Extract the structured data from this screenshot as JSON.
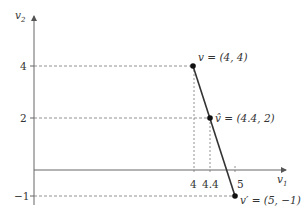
{
  "diagram": {
    "axes": {
      "x_label": "v",
      "x_label_sub": "1",
      "y_label": "v",
      "y_label_sub": "2"
    },
    "y_ticks": [
      {
        "value": 4,
        "label": "4"
      },
      {
        "value": 2,
        "label": "2"
      },
      {
        "value": -1,
        "label": "−1"
      }
    ],
    "x_ticks": [
      {
        "value": 4,
        "label": "4"
      },
      {
        "value": 4.4,
        "label": "4.4"
      },
      {
        "value": 5,
        "label": "5"
      }
    ],
    "points": [
      {
        "name": "v",
        "label": "v = (4, 4)",
        "x": 4,
        "y": 4
      },
      {
        "name": "v-hat",
        "label": "v̂ = (4.4, 2)",
        "x": 4.4,
        "y": 2
      },
      {
        "name": "v-prime",
        "label": "v′ = (5, −1)",
        "x": 5,
        "y": -1
      }
    ],
    "colors": {
      "axis": "#555555",
      "line": "#333333",
      "point": "#111111",
      "dashed": "#666666"
    }
  }
}
